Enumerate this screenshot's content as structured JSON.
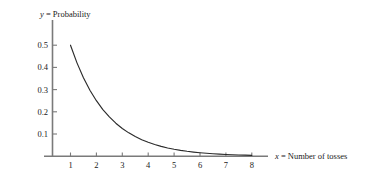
{
  "figure": {
    "background_color": "#ffffff",
    "axis_color": "#7a7a7a",
    "curve_color": "#2b2b2b",
    "text_color": "#1a1a1a"
  },
  "labels": {
    "y_axis_var": "y",
    "y_axis_eq": " = Probability",
    "y_axis_full": "y = Probability",
    "x_axis_var": "x",
    "x_axis_eq": " = Number of tosses",
    "x_axis_full": "x = Number of tosses"
  },
  "chart_data": {
    "type": "line",
    "title": "",
    "subtitle": "",
    "xlabel": "x = Number of tosses",
    "ylabel": "y = Probability",
    "xlim": [
      0,
      8.6
    ],
    "ylim": [
      0,
      0.56
    ],
    "grid": false,
    "legend": null,
    "x_ticks": [
      1,
      2,
      3,
      4,
      5,
      6,
      7,
      8
    ],
    "x_tick_labels": [
      "1",
      "2",
      "3",
      "4",
      "5",
      "6",
      "7",
      "8"
    ],
    "y_ticks": [
      0.1,
      0.2,
      0.3,
      0.4,
      0.5
    ],
    "y_tick_labels": [
      "0.1",
      "0.2",
      "0.3",
      "0.4",
      "0.5"
    ],
    "series": [
      {
        "name": "Probability of first head on toss x",
        "formula": "y = 0.5^x",
        "x": [
          1,
          1.25,
          1.5,
          1.75,
          2,
          2.25,
          2.5,
          2.75,
          3,
          3.25,
          3.5,
          3.75,
          4,
          4.25,
          4.5,
          4.75,
          5,
          5.25,
          5.5,
          5.75,
          6,
          6.25,
          6.5,
          6.75,
          7,
          7.25,
          7.5,
          7.75,
          8
        ],
        "values": [
          0.5,
          0.4204,
          0.3536,
          0.2973,
          0.25,
          0.2102,
          0.1768,
          0.1487,
          0.125,
          0.1051,
          0.0884,
          0.0743,
          0.0625,
          0.0526,
          0.0442,
          0.0372,
          0.03125,
          0.0263,
          0.0221,
          0.0186,
          0.015625,
          0.0131,
          0.011,
          0.0093,
          0.0078125,
          0.0066,
          0.0055,
          0.0046,
          0.00390625
        ]
      }
    ],
    "annotations": []
  }
}
